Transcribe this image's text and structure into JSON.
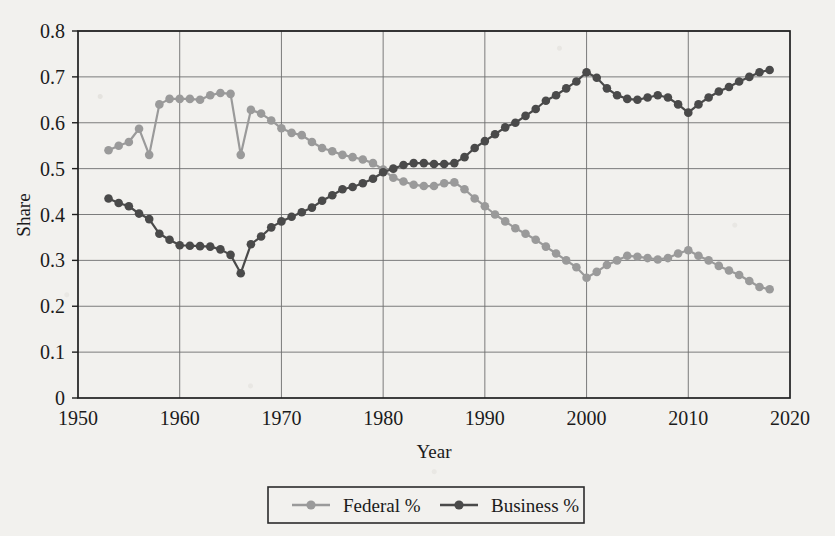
{
  "chart_data": {
    "type": "line",
    "title": "",
    "xlabel": "Year",
    "ylabel": "Share",
    "xlim": [
      1950,
      2020
    ],
    "ylim": [
      0,
      0.8
    ],
    "xticks": [
      1950,
      1960,
      1970,
      1980,
      1990,
      2000,
      2010,
      2020
    ],
    "yticks": [
      "0",
      "0.1",
      "0.2",
      "0.3",
      "0.4",
      "0.5",
      "0.6",
      "0.7",
      "0.8"
    ],
    "ytick_values": [
      0,
      0.1,
      0.2,
      0.3,
      0.4,
      0.5,
      0.6,
      0.7,
      0.8
    ],
    "grid": true,
    "legend_position": "below-center",
    "marker": "circle",
    "x": [
      1953,
      1954,
      1955,
      1956,
      1957,
      1958,
      1959,
      1960,
      1961,
      1962,
      1963,
      1964,
      1965,
      1966,
      1967,
      1968,
      1969,
      1970,
      1971,
      1972,
      1973,
      1974,
      1975,
      1976,
      1977,
      1978,
      1979,
      1980,
      1981,
      1982,
      1983,
      1984,
      1985,
      1986,
      1987,
      1988,
      1989,
      1990,
      1991,
      1992,
      1993,
      1994,
      1995,
      1996,
      1997,
      1998,
      1999,
      2000,
      2001,
      2002,
      2003,
      2004,
      2005,
      2006,
      2007,
      2008,
      2009,
      2010,
      2011,
      2012,
      2013,
      2014,
      2015,
      2016,
      2017,
      2018
    ],
    "series": [
      {
        "name": "Federal %",
        "color": "#9a9a9a",
        "values": [
          0.54,
          0.55,
          0.558,
          0.587,
          0.53,
          0.64,
          0.652,
          0.652,
          0.652,
          0.65,
          0.66,
          0.665,
          0.663,
          0.53,
          0.628,
          0.62,
          0.605,
          0.588,
          0.578,
          0.573,
          0.558,
          0.545,
          0.538,
          0.53,
          0.525,
          0.52,
          0.512,
          0.498,
          0.48,
          0.472,
          0.465,
          0.462,
          0.462,
          0.468,
          0.47,
          0.455,
          0.435,
          0.418,
          0.4,
          0.385,
          0.37,
          0.358,
          0.345,
          0.33,
          0.315,
          0.3,
          0.285,
          0.262,
          0.275,
          0.29,
          0.3,
          0.31,
          0.308,
          0.305,
          0.302,
          0.305,
          0.315,
          0.322,
          0.31,
          0.3,
          0.288,
          0.278,
          0.268,
          0.255,
          0.242,
          0.237
        ]
      },
      {
        "name": "Business %",
        "color": "#4a4a4a",
        "values": [
          0.435,
          0.425,
          0.418,
          0.402,
          0.39,
          0.358,
          0.345,
          0.333,
          0.332,
          0.331,
          0.33,
          0.324,
          0.312,
          0.272,
          0.335,
          0.352,
          0.372,
          0.385,
          0.395,
          0.405,
          0.415,
          0.43,
          0.442,
          0.455,
          0.46,
          0.468,
          0.478,
          0.492,
          0.5,
          0.508,
          0.512,
          0.512,
          0.51,
          0.51,
          0.512,
          0.525,
          0.545,
          0.56,
          0.575,
          0.59,
          0.6,
          0.615,
          0.63,
          0.648,
          0.66,
          0.675,
          0.69,
          0.71,
          0.698,
          0.675,
          0.66,
          0.652,
          0.65,
          0.655,
          0.66,
          0.655,
          0.64,
          0.622,
          0.64,
          0.655,
          0.668,
          0.678,
          0.69,
          0.7,
          0.71,
          0.715
        ]
      }
    ]
  },
  "legend": {
    "items": [
      {
        "label": "Federal %",
        "color": "#9a9a9a"
      },
      {
        "label": "Business %",
        "color": "#4a4a4a"
      }
    ]
  }
}
